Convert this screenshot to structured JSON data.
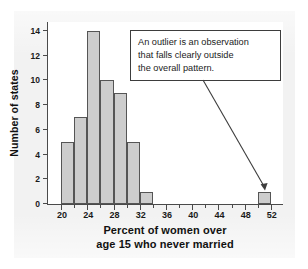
{
  "chart_data": {
    "type": "bar",
    "title": "",
    "xlabel_lines": [
      "Percent of women over",
      "age 15 who never married"
    ],
    "xlabel": "Percent of women over age 15 who never married",
    "ylabel": "Number of states",
    "xlim": [
      18,
      54
    ],
    "ylim": [
      0,
      14.8
    ],
    "grid": false,
    "legend": "none",
    "bin_width": 2,
    "x_major_ticks": [
      20,
      24,
      28,
      32,
      36,
      40,
      44,
      48,
      52
    ],
    "x_minor_ticks": [
      22,
      26,
      30,
      34,
      38,
      42,
      46,
      50
    ],
    "x_tick_labels": [
      "20",
      "24",
      "28",
      "32",
      "36",
      "40",
      "44",
      "48",
      "52"
    ],
    "y_ticks": [
      0,
      2,
      4,
      6,
      8,
      10,
      12,
      14
    ],
    "y_tick_labels": [
      "0",
      "2",
      "4",
      "6",
      "8",
      "10",
      "12",
      "14"
    ],
    "bars": [
      {
        "bin_start": 20,
        "bin_end": 22,
        "count": 5
      },
      {
        "bin_start": 22,
        "bin_end": 24,
        "count": 7
      },
      {
        "bin_start": 24,
        "bin_end": 26,
        "count": 14
      },
      {
        "bin_start": 26,
        "bin_end": 28,
        "count": 10
      },
      {
        "bin_start": 28,
        "bin_end": 30,
        "count": 9
      },
      {
        "bin_start": 30,
        "bin_end": 32,
        "count": 5
      },
      {
        "bin_start": 32,
        "bin_end": 34,
        "count": 1
      },
      {
        "bin_start": 50,
        "bin_end": 52,
        "count": 1
      }
    ],
    "categories": [
      "20-22",
      "22-24",
      "24-26",
      "26-28",
      "28-30",
      "30-32",
      "32-34",
      "50-52"
    ],
    "values": [
      5,
      7,
      14,
      10,
      9,
      5,
      1,
      1
    ],
    "colors": {
      "bar_fill": "#cdcdcd",
      "bar_stroke": "#555555",
      "axis": "#4a4a4a",
      "text": "#111111",
      "panel": "#f2f2f2",
      "callout_border": "#3d3d3d"
    },
    "annotations": [
      {
        "text": "An outlier is an observation that falls clearly outside the overall pattern.",
        "lines": [
          "An outlier is an observation",
          "that falls clearly outside",
          "the overall pattern."
        ],
        "points_to_bin": "50-52"
      }
    ]
  }
}
